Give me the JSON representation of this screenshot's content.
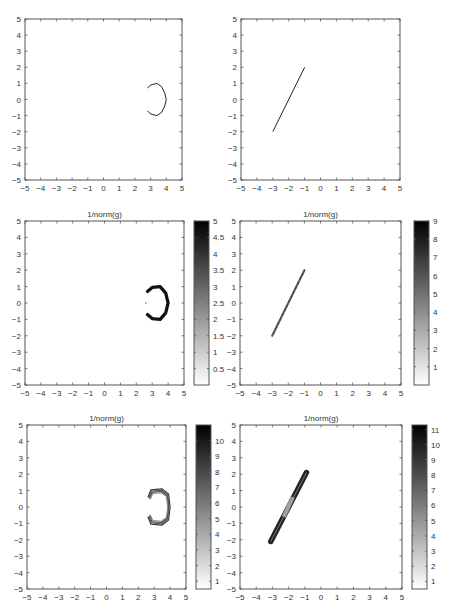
{
  "chart_data": [
    {
      "type": "line",
      "panel": "row1-left",
      "title": "",
      "xlim": [
        -5,
        5
      ],
      "ylim": [
        -5,
        5
      ],
      "xticks": [
        -5,
        -4,
        -3,
        -2,
        -1,
        0,
        1,
        2,
        3,
        4,
        5
      ],
      "yticks": [
        -5,
        -4,
        -3,
        -2,
        -1,
        0,
        1,
        2,
        3,
        4,
        5
      ],
      "curve": "C-shaped arc centered near (3.3,0), x from ~2.8 to 4.0, y from -1 to 1",
      "points": [
        [
          2.8,
          0.7
        ],
        [
          3.0,
          0.9
        ],
        [
          3.4,
          1.0
        ],
        [
          3.7,
          0.8
        ],
        [
          3.9,
          0.4
        ],
        [
          4.0,
          0.0
        ],
        [
          3.9,
          -0.4
        ],
        [
          3.7,
          -0.8
        ],
        [
          3.4,
          -1.0
        ],
        [
          3.0,
          -0.9
        ],
        [
          2.8,
          -0.7
        ]
      ],
      "colorbar": null
    },
    {
      "type": "line",
      "panel": "row1-right",
      "title": "",
      "xlim": [
        -5,
        5
      ],
      "ylim": [
        -5,
        5
      ],
      "xticks": [
        -5,
        -4,
        -3,
        -2,
        -1,
        0,
        1,
        2,
        3,
        4,
        5
      ],
      "yticks": [
        -5,
        -4,
        -3,
        -2,
        -1,
        0,
        1,
        2,
        3,
        4,
        5
      ],
      "curve": "straight segment from (-3,-2) to (-1,2)",
      "points": [
        [
          -3,
          -2
        ],
        [
          -1,
          2
        ]
      ],
      "colorbar": null
    },
    {
      "type": "scatter",
      "panel": "row2-left",
      "title": "1/norm(g)",
      "xlim": [
        -5,
        5
      ],
      "ylim": [
        -5,
        5
      ],
      "xticks": [
        -5,
        -4,
        -3,
        -2,
        -1,
        0,
        1,
        2,
        3,
        4,
        5
      ],
      "yticks": [
        -5,
        -4,
        -3,
        -2,
        -1,
        0,
        1,
        2,
        3,
        4,
        5
      ],
      "curve": "thick C-shaped arc near (3.3,0), dark (high values)",
      "points": [
        [
          2.7,
          0.7
        ],
        [
          3.0,
          0.95
        ],
        [
          3.5,
          1.0
        ],
        [
          3.85,
          0.6
        ],
        [
          4.0,
          0.0
        ],
        [
          3.85,
          -0.6
        ],
        [
          3.5,
          -1.0
        ],
        [
          3.0,
          -0.95
        ],
        [
          2.7,
          -0.7
        ]
      ],
      "colorbar": {
        "min": 0,
        "max": 5,
        "ticks": [
          0.5,
          1,
          1.5,
          2,
          2.5,
          3,
          3.5,
          4,
          4.5,
          5
        ],
        "colormap": "gray-reversed"
      }
    },
    {
      "type": "scatter",
      "panel": "row2-right",
      "title": "1/norm(g)",
      "xlim": [
        -5,
        5
      ],
      "ylim": [
        -5,
        5
      ],
      "xticks": [
        -5,
        -4,
        -3,
        -2,
        -1,
        0,
        1,
        2,
        3,
        4,
        5
      ],
      "yticks": [
        -5,
        -4,
        -3,
        -2,
        -1,
        0,
        1,
        2,
        3,
        4,
        5
      ],
      "curve": "thin segment from (-3,-2) to (-1,2), mid-gray",
      "points": [
        [
          -3,
          -2
        ],
        [
          -1,
          2
        ]
      ],
      "colorbar": {
        "min": 0,
        "max": 9,
        "ticks": [
          1,
          2,
          3,
          4,
          5,
          6,
          7,
          8,
          9
        ],
        "colormap": "gray-reversed"
      }
    },
    {
      "type": "scatter",
      "panel": "row3-left",
      "title": "1/norm(g)",
      "xlim": [
        -5,
        5
      ],
      "ylim": [
        -5,
        5
      ],
      "xticks": [
        -5,
        -4,
        -3,
        -2,
        -1,
        0,
        1,
        2,
        3,
        4,
        5
      ],
      "yticks": [
        -5,
        -4,
        -3,
        -2,
        -1,
        0,
        1,
        2,
        3,
        4,
        5
      ],
      "curve": "band of concentric C-shaped contours near (3.3,0), x 2.6–4.0, y -1.1–1.1",
      "points": [
        [
          2.6,
          0.6
        ],
        [
          2.8,
          1.05
        ],
        [
          3.5,
          1.1
        ],
        [
          3.9,
          0.8
        ],
        [
          4.0,
          0
        ],
        [
          3.9,
          -0.8
        ],
        [
          3.5,
          -1.1
        ],
        [
          2.8,
          -1.05
        ],
        [
          2.6,
          -0.6
        ]
      ],
      "colorbar": {
        "min": 0.5,
        "max": 11,
        "ticks": [
          1,
          2,
          3,
          4,
          5,
          6,
          7,
          8,
          9,
          10
        ],
        "colormap": "gray-reversed"
      }
    },
    {
      "type": "scatter",
      "panel": "row3-right",
      "title": "1/norm(g)",
      "xlim": [
        -5,
        5
      ],
      "ylim": [
        -5,
        5
      ],
      "xticks": [
        -5,
        -4,
        -3,
        -2,
        -1,
        0,
        1,
        2,
        3,
        4,
        5
      ],
      "yticks": [
        -5,
        -4,
        -3,
        -2,
        -1,
        0,
        1,
        2,
        3,
        4,
        5
      ],
      "curve": "thick band from (-3.1,-2.1) to (-0.9,2.1), darker at ends, lighter near middle",
      "points": [
        [
          -3.1,
          -2.1
        ],
        [
          -0.9,
          2.1
        ]
      ],
      "colorbar": {
        "min": 0.5,
        "max": 11.3,
        "ticks": [
          1,
          2,
          3,
          4,
          5,
          6,
          7,
          8,
          9,
          10,
          11
        ],
        "colormap": "gray-reversed"
      }
    }
  ],
  "panels": {
    "titles": [
      "",
      "",
      "1/norm(g)",
      "1/norm(g)",
      "1/norm(g)",
      "1/norm(g)"
    ],
    "tick_labels": [
      "-5",
      "-4",
      "-3",
      "-2",
      "-1",
      "0",
      "1",
      "2",
      "3",
      "4",
      "5"
    ],
    "cb1_labels": [
      "5",
      "4.5",
      "4",
      "3.5",
      "3",
      "2.5",
      "2",
      "1.5",
      "1",
      "0.5"
    ],
    "cb2_labels": [
      "9",
      "8",
      "7",
      "6",
      "5",
      "4",
      "3",
      "2",
      "1"
    ],
    "cb3_labels": [
      "10",
      "9",
      "8",
      "7",
      "6",
      "5",
      "4",
      "3",
      "2",
      "1"
    ],
    "cb4_labels": [
      "11",
      "10",
      "9",
      "8",
      "7",
      "6",
      "5",
      "4",
      "3",
      "2",
      "1"
    ]
  },
  "colors": {
    "axis": "#555555",
    "curve": "#222222",
    "text": "#333333"
  }
}
